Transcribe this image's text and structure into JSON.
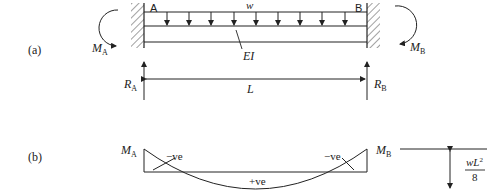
{
  "figure": {
    "part_a": {
      "label": "(a)",
      "support_left": "A",
      "support_right": "B",
      "load": "w",
      "stiffness": "EI",
      "span": "L",
      "moment_left": {
        "symbol": "M",
        "sub": "A"
      },
      "moment_right": {
        "symbol": "M",
        "sub": "B"
      },
      "reaction_left": {
        "symbol": "R",
        "sub": "A"
      },
      "reaction_right": {
        "symbol": "R",
        "sub": "B"
      }
    },
    "part_b": {
      "label": "(b)",
      "moment_left": {
        "symbol": "M",
        "sub": "A"
      },
      "moment_right": {
        "symbol": "M",
        "sub": "B"
      },
      "neg_left": "−ve",
      "neg_right": "−ve",
      "positive": "+ve",
      "dimension": {
        "numerator_w": "w",
        "numerator_L": "L",
        "numerator_exp": "2",
        "denominator": "8"
      }
    }
  },
  "colors": {
    "ink": "#222222",
    "background": "#ffffff"
  }
}
